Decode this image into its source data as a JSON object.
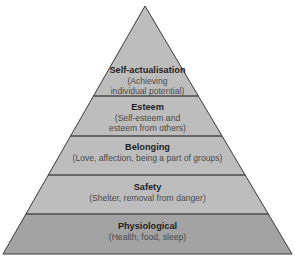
{
  "diagram": {
    "type": "pyramid",
    "levels": [
      {
        "title": "Self-actualisation",
        "description_lines": [
          "(Achieving",
          "individual potential)"
        ],
        "fill": "#bdbdbd"
      },
      {
        "title": "Esteem",
        "description_lines": [
          "(Self-esteem and",
          "esteem from others)"
        ],
        "fill": "#bdbdbd"
      },
      {
        "title": "Belonging",
        "description_lines": [
          "(Love, affection, being a part of groups)"
        ],
        "fill": "#bdbdbd"
      },
      {
        "title": "Safety",
        "description_lines": [
          "(Shelter, removal from danger)"
        ],
        "fill": "#bdbdbd"
      },
      {
        "title": "Physiological",
        "description_lines": [
          "(Health, food, sleep)"
        ],
        "fill": "#a3a3a3"
      }
    ],
    "divider_color": "#4d4d4d",
    "outline_color": "#3a3a3a"
  }
}
